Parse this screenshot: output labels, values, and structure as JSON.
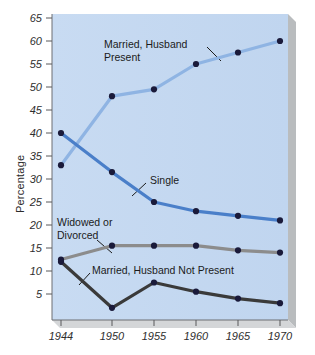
{
  "chart_data": {
    "type": "line",
    "title": "",
    "xlabel": "",
    "ylabel": "Percentage",
    "x": [
      1944,
      1950,
      1955,
      1960,
      1965,
      1970
    ],
    "xtick_labels": [
      "1944",
      "1950",
      "1955",
      "1960",
      "1965",
      "1970"
    ],
    "ytick_labels": [
      "5",
      "10",
      "15",
      "20",
      "25",
      "30",
      "35",
      "40",
      "45",
      "50",
      "55",
      "60",
      "65"
    ],
    "yticks": [
      5,
      10,
      15,
      20,
      25,
      30,
      35,
      40,
      45,
      50,
      55,
      60,
      65
    ],
    "ylim": [
      0,
      65
    ],
    "xlim": [
      1942,
      1972
    ],
    "grid": false,
    "legend_position": "inline-annotations",
    "plot_background": "#c3d7f0",
    "series": [
      {
        "name": "Married, Husband Present",
        "values": [
          33,
          48,
          49.5,
          55,
          57.5,
          60
        ],
        "color": "#8fb4e3",
        "marker_color": "#1a1a3a"
      },
      {
        "name": "Single",
        "values": [
          40,
          31.5,
          25,
          23,
          22,
          21
        ],
        "color": "#4a7fc9",
        "marker_color": "#1a1a3a"
      },
      {
        "name": "Widowed or Divorced",
        "values": [
          12.5,
          15.5,
          15.5,
          15.5,
          14.5,
          14
        ],
        "color": "#8c8c8c",
        "marker_color": "#1a1a3a"
      },
      {
        "name": "Married, Husband Not Present",
        "values": [
          12,
          2,
          7.5,
          5.5,
          4,
          3
        ],
        "color": "#3a3a3a",
        "marker_color": "#1a1a3a"
      }
    ],
    "annotations": [
      {
        "text_line1": "Married, Husband",
        "text_line2": "Present"
      },
      {
        "text_line1": "Single",
        "text_line2": ""
      },
      {
        "text_line1": "Widowed or",
        "text_line2": "Divorced"
      },
      {
        "text_line1": "Married, Husband Not Present",
        "text_line2": ""
      }
    ]
  },
  "labels": {
    "y_axis_title": "Percentage",
    "married_husband_present_l1": "Married, Husband",
    "married_husband_present_l2": "Present",
    "single": "Single",
    "widowed_divorced_l1": "Widowed or",
    "widowed_divorced_l2": "Divorced",
    "married_husband_not_present": "Married, Husband Not Present",
    "y_5": "5",
    "y_10": "10",
    "y_15": "15",
    "y_20": "20",
    "y_25": "25",
    "y_30": "30",
    "y_35": "35",
    "y_40": "40",
    "y_45": "45",
    "y_50": "50",
    "y_55": "55",
    "y_60": "60",
    "y_65": "65",
    "x_1944": "1944",
    "x_1950": "1950",
    "x_1955": "1955",
    "x_1960": "1960",
    "x_1965": "1965",
    "x_1970": "1970"
  }
}
